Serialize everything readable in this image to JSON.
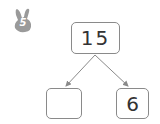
{
  "badge": {
    "icon": "bunny-icon",
    "number": "5",
    "color": "#9a9a9a"
  },
  "diagram": {
    "type": "number-bond",
    "whole": "15",
    "parts": [
      {
        "value": ""
      },
      {
        "value": "6"
      }
    ],
    "line_color": "#8a8a8a"
  }
}
